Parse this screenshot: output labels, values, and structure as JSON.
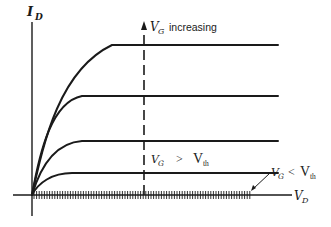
{
  "diagram": {
    "type": "mosfet-output-characteristics",
    "axes": {
      "y_label_main": "I",
      "y_label_sub": "D",
      "x_label_main": "V",
      "x_label_sub": "D"
    },
    "annotations": {
      "vg_increasing_main": "V",
      "vg_increasing_sub": "G",
      "vg_increasing_text": "increasing",
      "above_threshold_vg_main": "V",
      "above_threshold_vg_sub": "G",
      "above_threshold_op": ">",
      "above_threshold_vth_main": "V",
      "above_threshold_vth_sub": "th",
      "below_threshold_vg_main": "V",
      "below_threshold_vg_sub": "G",
      "below_threshold_op": "<",
      "below_threshold_vth_main": "V",
      "below_threshold_vth_sub": "th"
    },
    "curves": [
      {
        "name": "curve-1",
        "plateau_level": "highest"
      },
      {
        "name": "curve-2",
        "plateau_level": "high"
      },
      {
        "name": "curve-3",
        "plateau_level": "medium"
      },
      {
        "name": "curve-4",
        "plateau_level": "low"
      }
    ],
    "colors": {
      "stroke": "#1a1a1a",
      "background": "#ffffff"
    }
  }
}
